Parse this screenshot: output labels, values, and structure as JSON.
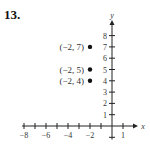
{
  "problem_number": "13.",
  "chart_data": {
    "type": "scatter",
    "title": "",
    "xlabel": "x",
    "ylabel": "y",
    "xlim": [
      -8.5,
      2
    ],
    "ylim": [
      -1,
      9
    ],
    "x_ticks": [
      -8,
      -7,
      -6,
      -5,
      -4,
      -3,
      -2,
      -1,
      1
    ],
    "x_tick_labels": [
      {
        "value": -8,
        "label": "−8"
      },
      {
        "value": -6,
        "label": "−6"
      },
      {
        "value": -4,
        "label": "−4"
      },
      {
        "value": -2,
        "label": "−2"
      },
      {
        "value": 1,
        "label": "1"
      }
    ],
    "y_ticks": [
      -1,
      1,
      2,
      3,
      4,
      5,
      6,
      7,
      8
    ],
    "y_tick_labels": [
      {
        "value": 1,
        "label": "1"
      },
      {
        "value": 2,
        "label": "2"
      },
      {
        "value": 3,
        "label": "3"
      },
      {
        "value": 4,
        "label": "4"
      },
      {
        "value": 5,
        "label": "5"
      },
      {
        "value": 6,
        "label": "6"
      },
      {
        "value": 7,
        "label": "7"
      },
      {
        "value": 8,
        "label": "8"
      }
    ],
    "grid": false,
    "points": [
      {
        "x": -2,
        "y": 7,
        "label": "(−2, 7)"
      },
      {
        "x": -2,
        "y": 5,
        "label": "(−2, 5)"
      },
      {
        "x": -2,
        "y": 4,
        "label": "(−2, 4)"
      }
    ]
  }
}
